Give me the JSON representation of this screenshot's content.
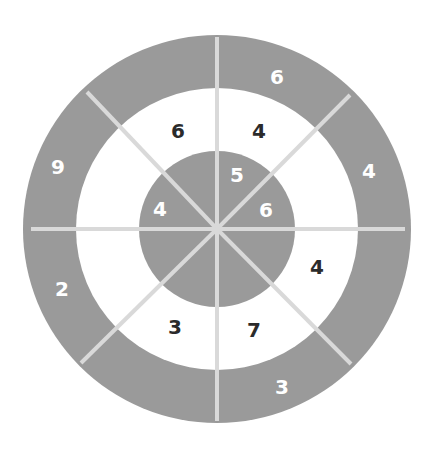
{
  "diagram": {
    "type": "concentric-ring-number-puzzle",
    "center": [
      217,
      229
    ],
    "radii": {
      "outer": 194,
      "middle": 141,
      "inner": 78
    },
    "segments": 8,
    "colors": {
      "ring_fill": "#9a9a9a",
      "middle_fill": "#ffffff",
      "divider": "#d9d9d9",
      "dark_text": "#2b2b2b",
      "light_text": "#ffffff"
    },
    "outer_ring": [
      {
        "label": "6",
        "x": 277,
        "y": 77
      },
      {
        "label": "4",
        "x": 369,
        "y": 171
      },
      {
        "label": "3",
        "x": 282,
        "y": 387
      },
      {
        "label": "2",
        "x": 62,
        "y": 289
      },
      {
        "label": "9",
        "x": 58,
        "y": 167
      }
    ],
    "middle_ring": [
      {
        "label": "6",
        "x": 178,
        "y": 131
      },
      {
        "label": "4",
        "x": 259,
        "y": 131
      },
      {
        "label": "4",
        "x": 317,
        "y": 267
      },
      {
        "label": "7",
        "x": 254,
        "y": 330
      },
      {
        "label": "3",
        "x": 175,
        "y": 327
      }
    ],
    "inner_circle": [
      {
        "label": "5",
        "x": 237,
        "y": 175
      },
      {
        "label": "6",
        "x": 266,
        "y": 210
      },
      {
        "label": "4",
        "x": 160,
        "y": 209
      }
    ]
  }
}
